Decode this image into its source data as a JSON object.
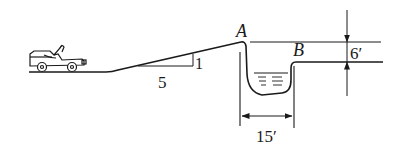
{
  "diagram": {
    "labels": {
      "point_a": "A",
      "point_b": "B",
      "slope_run": "5",
      "slope_rise": "1",
      "ditch_width": "15′",
      "height_drop": "6′"
    },
    "icons": {
      "vehicle": "jeep-icon",
      "water": "water-icon"
    },
    "colors": {
      "ink": "#1a1a1a",
      "background": "#ffffff"
    }
  }
}
